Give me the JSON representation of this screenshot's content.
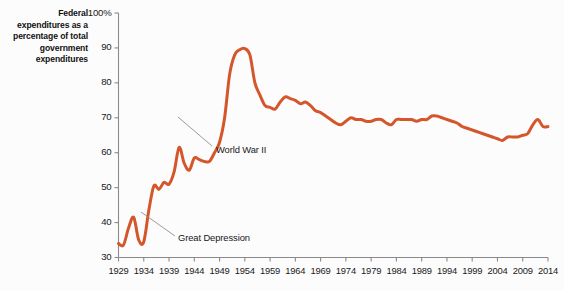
{
  "chart_data": {
    "type": "line",
    "title": "",
    "ylabel": "Federal expenditures as a percentage of total government expenditures",
    "xlabel": "",
    "ylim": [
      30,
      100
    ],
    "xlim": [
      1929,
      2014
    ],
    "grid": false,
    "legend": "none",
    "y_ticks": [
      {
        "value": 100,
        "label": "100%"
      },
      {
        "value": 90,
        "label": "90"
      },
      {
        "value": 80,
        "label": "80"
      },
      {
        "value": 70,
        "label": "70"
      },
      {
        "value": 60,
        "label": "60"
      },
      {
        "value": 50,
        "label": "50"
      },
      {
        "value": 40,
        "label": "40"
      },
      {
        "value": 30,
        "label": "30"
      }
    ],
    "x_ticks": [
      {
        "value": 1929,
        "label": "1929"
      },
      {
        "value": 1934,
        "label": "1934"
      },
      {
        "value": 1939,
        "label": "1939"
      },
      {
        "value": 1944,
        "label": "1944"
      },
      {
        "value": 1949,
        "label": "1949"
      },
      {
        "value": 1954,
        "label": "1954"
      },
      {
        "value": 1959,
        "label": "1959"
      },
      {
        "value": 1964,
        "label": "1964"
      },
      {
        "value": 1969,
        "label": "1969"
      },
      {
        "value": 1974,
        "label": "1974"
      },
      {
        "value": 1979,
        "label": "1979"
      },
      {
        "value": 1984,
        "label": "1984"
      },
      {
        "value": 1989,
        "label": "1989"
      },
      {
        "value": 1994,
        "label": "1994"
      },
      {
        "value": 1999,
        "label": "1999"
      },
      {
        "value": 2004,
        "label": "2004"
      },
      {
        "value": 2009,
        "label": "2009"
      },
      {
        "value": 2014,
        "label": "2014"
      }
    ],
    "series": [
      {
        "name": "Federal share of total government expenditures",
        "color": "#d4562b",
        "x": [
          1929,
          1930,
          1931,
          1932,
          1933,
          1934,
          1935,
          1936,
          1937,
          1938,
          1939,
          1940,
          1941,
          1942,
          1943,
          1944,
          1945,
          1946,
          1947,
          1948,
          1949,
          1950,
          1951,
          1952,
          1953,
          1954,
          1955,
          1956,
          1957,
          1958,
          1959,
          1960,
          1961,
          1962,
          1963,
          1964,
          1965,
          1966,
          1967,
          1968,
          1969,
          1970,
          1971,
          1972,
          1973,
          1974,
          1975,
          1976,
          1977,
          1978,
          1979,
          1980,
          1981,
          1982,
          1983,
          1984,
          1985,
          1986,
          1987,
          1988,
          1989,
          1990,
          1991,
          1992,
          1993,
          1994,
          1995,
          1996,
          1997,
          1998,
          1999,
          2000,
          2001,
          2002,
          2003,
          2004,
          2005,
          2006,
          2007,
          2008,
          2009,
          2010,
          2011,
          2012,
          2013,
          2014
        ],
        "values": [
          34.0,
          33.6,
          38.5,
          41.5,
          35.0,
          34.5,
          43.5,
          50.5,
          49.5,
          51.5,
          51.0,
          54.5,
          61.5,
          57.0,
          55.0,
          58.5,
          58.0,
          57.5,
          57.5,
          60.0,
          63.0,
          70.0,
          82.5,
          88.0,
          89.5,
          89.8,
          88.0,
          80.0,
          76.5,
          73.5,
          73.0,
          72.5,
          74.5,
          76.0,
          75.5,
          75.0,
          74.0,
          74.5,
          73.5,
          72.0,
          71.5,
          70.5,
          69.5,
          68.5,
          68.0,
          69.0,
          70.0,
          69.5,
          69.5,
          69.0,
          69.0,
          69.5,
          69.5,
          68.5,
          68.0,
          69.5,
          69.5,
          69.5,
          69.5,
          69.0,
          69.5,
          69.5,
          70.5,
          70.5,
          70.0,
          69.5,
          69.0,
          68.5,
          67.5,
          67.0,
          66.5,
          66.0,
          65.5,
          65.0,
          64.5,
          64.0,
          63.5,
          64.5,
          64.5,
          64.5,
          65.0,
          65.5,
          68.0,
          69.5,
          67.5,
          67.5
        ]
      }
    ],
    "annotations": [
      {
        "text": "World War II",
        "x_px": 216,
        "y_px": 150,
        "leader_from_x": 212,
        "leader_from_y": 146,
        "leader_to_x": 178,
        "leader_to_y": 117
      },
      {
        "text": "Great Depression",
        "x_px": 178,
        "y_px": 238,
        "leader_from_x": 175,
        "leader_from_y": 236,
        "leader_to_x": 141,
        "leader_to_y": 212
      }
    ]
  }
}
